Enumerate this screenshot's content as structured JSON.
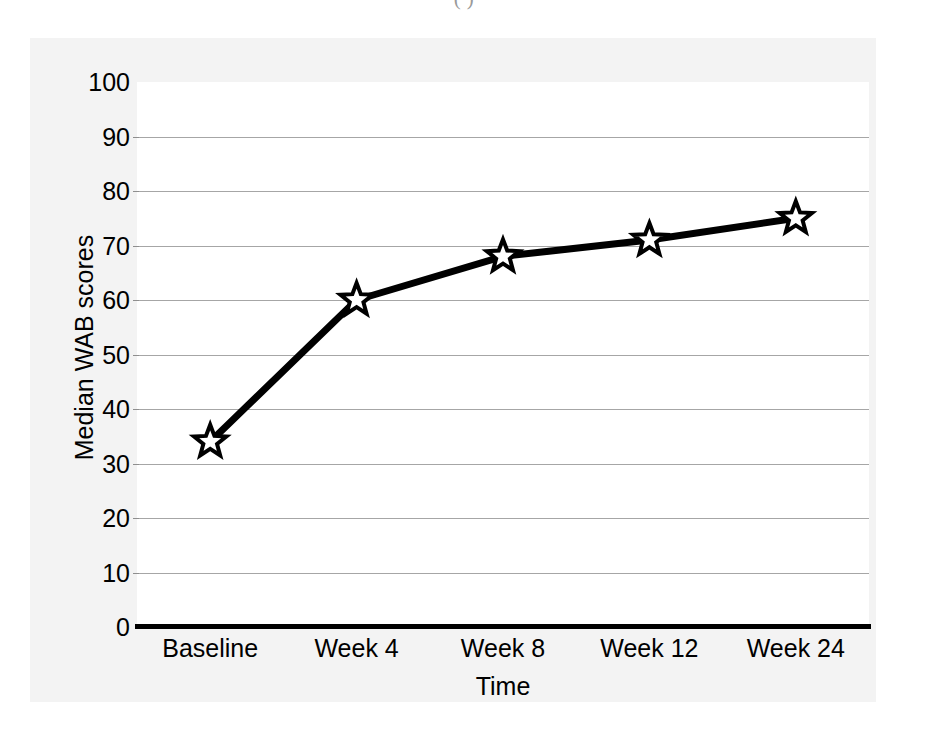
{
  "figure": {
    "caption_fragment": "(        )"
  },
  "chart_data": {
    "type": "line",
    "title": "",
    "subtitle": "",
    "xlabel": "Time",
    "ylabel": "Median WAB scores",
    "categories": [
      "Baseline",
      "Week 4",
      "Week 8",
      "Week 12",
      "Week 24"
    ],
    "values": [
      34,
      60,
      68,
      71,
      75
    ],
    "series": [
      {
        "name": "Median WAB scores",
        "values": [
          34,
          60,
          68,
          71,
          75
        ]
      }
    ],
    "ylim": [
      0,
      100
    ],
    "ytick_values": [
      0,
      10,
      20,
      30,
      40,
      50,
      60,
      70,
      80,
      90,
      100
    ],
    "ytick_labels": [
      "0",
      "10",
      "20",
      "30",
      "40",
      "50",
      "60",
      "70",
      "80",
      "90",
      "100"
    ],
    "grid": true,
    "grid_axis": "y",
    "legend": false,
    "legend_position": "none",
    "marker": "star",
    "marker_fill_color": "#ffffff",
    "marker_edge_color": "#000000",
    "line_color": "#000000",
    "line_width": 7,
    "plot_background_color": "#ffffff",
    "figure_background_color": "#f3f3f3",
    "gridline_color": "#a6a6a6",
    "axis_color": "#000000",
    "annotations": []
  }
}
